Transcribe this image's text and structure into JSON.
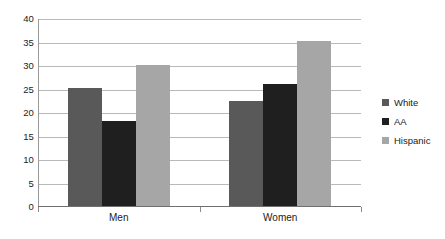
{
  "chart_data": {
    "type": "bar",
    "title": "",
    "subtitle": "",
    "xlabel": "",
    "ylabel": "",
    "categories": [
      "Men",
      "Women"
    ],
    "series": [
      {
        "name": "White",
        "color": "#595959",
        "values": [
          25,
          22.3
        ]
      },
      {
        "name": "AA",
        "color": "#1f1f1f",
        "values": [
          18,
          26
        ]
      },
      {
        "name": "Hispanic",
        "color": "#a6a6a6",
        "values": [
          30,
          35
        ]
      }
    ],
    "ylim": [
      0,
      40
    ],
    "y_ticks": [
      0,
      5,
      10,
      15,
      20,
      25,
      30,
      35,
      40
    ],
    "y_tick_labels": [
      "0",
      "5",
      "10",
      "15",
      "20",
      "25",
      "30",
      "35",
      "40"
    ],
    "grid": true,
    "grid_axis": "y",
    "legend_position": "right",
    "outer_border": false,
    "background_color": "#ffffff",
    "gridline_color": "#b9b9b9",
    "axis_color": "#6f6f6f",
    "text_color": "#222222"
  }
}
